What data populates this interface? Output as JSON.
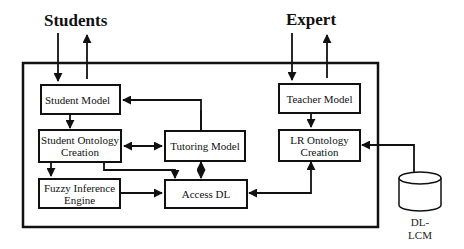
{
  "diagram": {
    "actors": {
      "students": "Students",
      "expert": "Expert"
    },
    "nodes": {
      "student_model": "Student Model",
      "student_ontology": "Student Ontology Creation",
      "student_ontology_l1": "Student Ontology",
      "student_ontology_l2": "Creation",
      "fuzzy": "Fuzzy Inference Engine",
      "fuzzy_l1": "Fuzzy Inference",
      "fuzzy_l2": "Engine",
      "tutoring": "Tutoring Model",
      "access_dl": "Access DL",
      "teacher": "Teacher Model",
      "lr_ontology": "LR Ontology Creation",
      "lr_ontology_l1": "LR Ontology",
      "lr_ontology_l2": "Creation",
      "database_l1": "DL-",
      "database_l2": "LCM"
    },
    "edges": [
      {
        "from": "Students",
        "to": "Student Model"
      },
      {
        "from": "Student Model",
        "to": "Students"
      },
      {
        "from": "Expert",
        "to": "Teacher Model"
      },
      {
        "from": "Teacher Model",
        "to": "Expert"
      },
      {
        "from": "Student Model",
        "to": "Student Ontology Creation"
      },
      {
        "from": "Tutoring Model",
        "to": "Student Model",
        "bidirectional": true
      },
      {
        "from": "Student Ontology Creation",
        "to": "Tutoring Model",
        "bidirectional": true
      },
      {
        "from": "Student Ontology Creation",
        "to": "Fuzzy Inference Engine"
      },
      {
        "from": "Student Ontology Creation",
        "to": "Access DL"
      },
      {
        "from": "Fuzzy Inference Engine",
        "to": "Access DL"
      },
      {
        "from": "Tutoring Model",
        "to": "Access DL",
        "bidirectional": true
      },
      {
        "from": "Teacher Model",
        "to": "LR Ontology Creation"
      },
      {
        "from": "LR Ontology Creation",
        "to": "Access DL",
        "bidirectional": true
      },
      {
        "from": "DL-LCM",
        "to": "LR Ontology Creation"
      }
    ]
  }
}
